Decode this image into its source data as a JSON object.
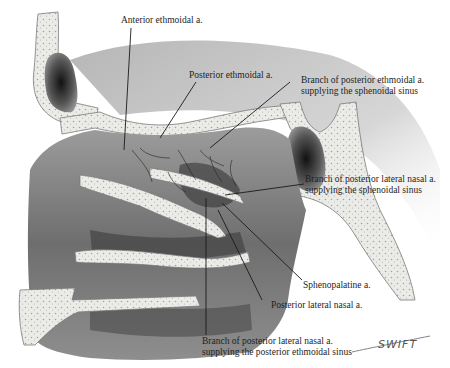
{
  "figure": {
    "colors": {
      "bone_fill": "#e9e9e6",
      "bone_stipple": "#9a9a98",
      "soft_tissue_dark": "#4a4a4a",
      "soft_tissue_mid": "#8a8a8a",
      "soft_tissue_light": "#c4c4c4",
      "background_shadow": "#b8b8b8",
      "leader_line": "#1a1a1a",
      "text": "#1e1e1e"
    }
  },
  "labels": [
    {
      "id": "anterior-ethmoidal",
      "lines": [
        "Anterior ethmoidal a."
      ]
    },
    {
      "id": "posterior-ethmoidal",
      "lines": [
        "Posterior ethmoidal a."
      ]
    },
    {
      "id": "branch-post-ethmoidal-sphenoidal",
      "lines": [
        "Branch of posterior ethmoidal a.",
        "supplying the sphenoidal sinus"
      ]
    },
    {
      "id": "branch-post-lat-nasal-sphenoidal",
      "lines": [
        "Branch of posterior lateral nasal a.",
        "supplying the sphenoidal sinus"
      ]
    },
    {
      "id": "sphenopalatine",
      "lines": [
        "Sphenopalatine a."
      ]
    },
    {
      "id": "posterior-lateral-nasal",
      "lines": [
        "Posterior lateral nasal a."
      ]
    },
    {
      "id": "branch-post-lat-nasal-ethmoidal",
      "lines": [
        "Branch of posterior lateral nasal a.",
        "supplying the posterior ethmoidal sinus"
      ]
    }
  ],
  "signature": "SWIFT"
}
